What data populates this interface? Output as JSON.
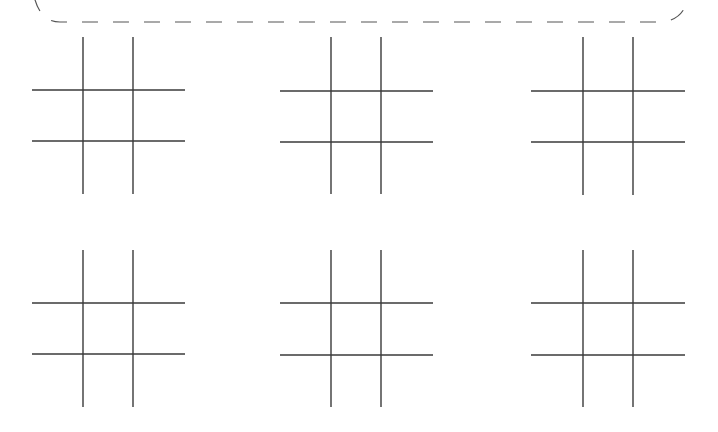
{
  "canvas": {
    "width": 718,
    "height": 432,
    "background": "#ffffff"
  },
  "colors": {
    "line": "#3a3a3a",
    "border": "#555555"
  },
  "border": {
    "style": "dashed-rounded",
    "top_y": 22,
    "left_x": 0,
    "right_x": 718
  },
  "boards": [
    {
      "id": "board-1",
      "row": 1,
      "col": 1,
      "x1": 32,
      "x2": 185,
      "y1": 37,
      "y2": 194,
      "v": [
        83,
        133
      ],
      "h": [
        90,
        141
      ]
    },
    {
      "id": "board-2",
      "row": 1,
      "col": 2,
      "x1": 280,
      "x2": 433,
      "y1": 37,
      "y2": 194,
      "v": [
        331,
        381
      ],
      "h": [
        91,
        142
      ]
    },
    {
      "id": "board-3",
      "row": 1,
      "col": 3,
      "x1": 531,
      "x2": 685,
      "y1": 37,
      "y2": 195,
      "v": [
        583,
        633
      ],
      "h": [
        91,
        142
      ]
    },
    {
      "id": "board-4",
      "row": 2,
      "col": 1,
      "x1": 32,
      "x2": 185,
      "y1": 250,
      "y2": 407,
      "v": [
        83,
        133
      ],
      "h": [
        303,
        354
      ]
    },
    {
      "id": "board-5",
      "row": 2,
      "col": 2,
      "x1": 280,
      "x2": 433,
      "y1": 250,
      "y2": 407,
      "v": [
        331,
        381
      ],
      "h": [
        303,
        355
      ]
    },
    {
      "id": "board-6",
      "row": 2,
      "col": 3,
      "x1": 531,
      "x2": 685,
      "y1": 250,
      "y2": 407,
      "v": [
        583,
        633
      ],
      "h": [
        303,
        355
      ]
    }
  ],
  "cells_state": "all-empty"
}
